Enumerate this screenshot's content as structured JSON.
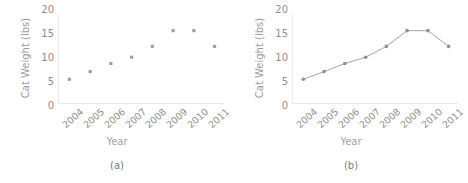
{
  "figure": {
    "panels": [
      {
        "caption": "(a)",
        "chart_data": {
          "type": "scatter",
          "title": "",
          "xlabel": "Year",
          "ylabel": "Cat Weight (lbs)",
          "categories": [
            "2004",
            "2005",
            "2006",
            "2007",
            "2008",
            "2009",
            "2010",
            "2011"
          ],
          "x": [
            2004,
            2005,
            2006,
            2007,
            2008,
            2009,
            2010,
            2011
          ],
          "values": [
            5.5,
            7.2,
            9.0,
            10.4,
            12.8,
            16.3,
            16.3,
            12.8
          ],
          "ylim": [
            0,
            20
          ],
          "yticks": [
            "20",
            "15",
            "10",
            "5",
            "0"
          ],
          "ytick_values": [
            20,
            15,
            10,
            5,
            0
          ],
          "grid": false,
          "legend": "none",
          "marker_color": "#9b9b9b",
          "marker_size": 2.2
        }
      },
      {
        "caption": "(b)",
        "chart_data": {
          "type": "line",
          "title": "",
          "xlabel": "Year",
          "ylabel": "Cat Weight (lbs)",
          "categories": [
            "2004",
            "2005",
            "2006",
            "2007",
            "2008",
            "2009",
            "2010",
            "2011"
          ],
          "x": [
            2004,
            2005,
            2006,
            2007,
            2008,
            2009,
            2010,
            2011
          ],
          "values": [
            5.5,
            7.2,
            9.0,
            10.4,
            12.8,
            16.3,
            16.3,
            12.8
          ],
          "ylim": [
            0,
            20
          ],
          "yticks": [
            "20",
            "15",
            "10",
            "5",
            "0"
          ],
          "ytick_values": [
            20,
            15,
            10,
            5,
            0
          ],
          "grid": false,
          "legend": "none",
          "line_color": "#9b9b9b",
          "marker_color": "#8f8f8f",
          "marker_size": 1.8
        }
      }
    ]
  }
}
